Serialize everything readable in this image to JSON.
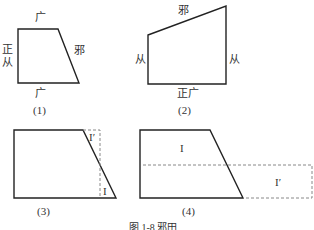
{
  "figure_caption": "图 1-8 邪田",
  "figures": [
    {
      "id": "1",
      "caption": "(1)",
      "labels": {
        "top": "广",
        "bottom": "广",
        "left_1": "正",
        "left_2": "从",
        "slant": "邪"
      }
    },
    {
      "id": "2",
      "caption": "(2)",
      "labels": {
        "slant": "邪",
        "left": "从",
        "right": "从",
        "bottom": "正广"
      }
    },
    {
      "id": "3",
      "caption": "(3)",
      "labels": {
        "region_top": "I′",
        "region_bottom": "I"
      }
    },
    {
      "id": "4",
      "caption": "(4)",
      "labels": {
        "region_top": "I",
        "region_right": "I′"
      }
    }
  ],
  "colors": {
    "stroke": "#222222",
    "dashed": "#888888",
    "background": "#ffffff"
  }
}
